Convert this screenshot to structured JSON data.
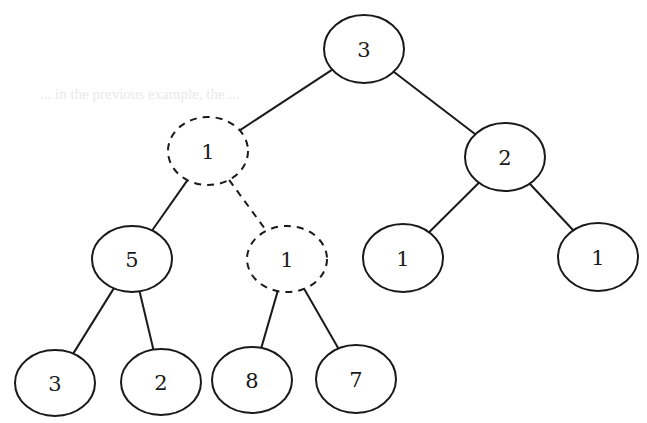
{
  "diagram": {
    "type": "binary-tree",
    "background_bleed_text": "... in the previous example, the ...",
    "colors": {
      "stroke": "#1a1a1a",
      "fill": "#ffffff",
      "background": "#ffffff"
    },
    "nodes": [
      {
        "id": "n0",
        "label": "3",
        "cx": 364,
        "cy": 49,
        "rx": 40,
        "ry": 34,
        "style": "solid"
      },
      {
        "id": "n1",
        "label": "1",
        "cx": 208,
        "cy": 151,
        "rx": 40,
        "ry": 34,
        "style": "dashed"
      },
      {
        "id": "n2",
        "label": "2",
        "cx": 505,
        "cy": 157,
        "rx": 40,
        "ry": 34,
        "style": "solid"
      },
      {
        "id": "n3",
        "label": "5",
        "cx": 132,
        "cy": 259,
        "rx": 40,
        "ry": 33,
        "style": "solid"
      },
      {
        "id": "n4",
        "label": "1",
        "cx": 287,
        "cy": 259,
        "rx": 40,
        "ry": 33,
        "style": "dashed"
      },
      {
        "id": "n5",
        "label": "1",
        "cx": 403,
        "cy": 258,
        "rx": 40,
        "ry": 34,
        "style": "solid"
      },
      {
        "id": "n6",
        "label": "1",
        "cx": 598,
        "cy": 257,
        "rx": 40,
        "ry": 34,
        "style": "solid"
      },
      {
        "id": "n7",
        "label": "3",
        "cx": 55,
        "cy": 383,
        "rx": 40,
        "ry": 33,
        "style": "solid"
      },
      {
        "id": "n8",
        "label": "2",
        "cx": 161,
        "cy": 382,
        "rx": 40,
        "ry": 33,
        "style": "solid"
      },
      {
        "id": "n9",
        "label": "8",
        "cx": 252,
        "cy": 380,
        "rx": 40,
        "ry": 33,
        "style": "solid"
      },
      {
        "id": "n10",
        "label": "7",
        "cx": 356,
        "cy": 379,
        "rx": 40,
        "ry": 34,
        "style": "solid"
      }
    ],
    "edges": [
      {
        "from": "n0",
        "to": "n1",
        "style": "solid"
      },
      {
        "from": "n0",
        "to": "n2",
        "style": "solid"
      },
      {
        "from": "n1",
        "to": "n3",
        "style": "solid"
      },
      {
        "from": "n1",
        "to": "n4",
        "style": "dashed"
      },
      {
        "from": "n2",
        "to": "n5",
        "style": "solid"
      },
      {
        "from": "n2",
        "to": "n6",
        "style": "solid"
      },
      {
        "from": "n3",
        "to": "n7",
        "style": "solid"
      },
      {
        "from": "n3",
        "to": "n8",
        "style": "solid"
      },
      {
        "from": "n4",
        "to": "n9",
        "style": "solid"
      },
      {
        "from": "n4",
        "to": "n10",
        "style": "solid"
      }
    ]
  }
}
